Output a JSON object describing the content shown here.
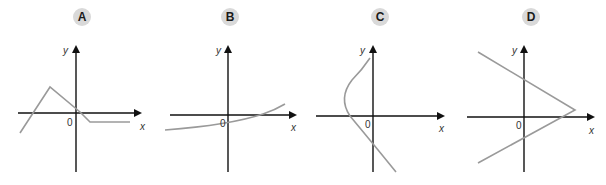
{
  "graphs": [
    {
      "id": "A",
      "label": "A",
      "x_axis_label": "x",
      "y_axis_label": "y",
      "origin_label": "0",
      "description": "Piecewise linear: rises from lower-left, peaks in second quadrant, falls through origin area, then flat horizontal below x-axis"
    },
    {
      "id": "B",
      "label": "B",
      "x_axis_label": "x",
      "y_axis_label": "y",
      "origin_label": "0",
      "description": "Gently increasing concave-up curve, negative y-intercept, crossing x-axis at positive x"
    },
    {
      "id": "C",
      "label": "C",
      "x_axis_label": "x",
      "y_axis_label": "y",
      "origin_label": "0",
      "description": "Curve bulging to the left of the y-axis (not a function of x), ending lower-right"
    },
    {
      "id": "D",
      "label": "D",
      "x_axis_label": "x",
      "y_axis_label": "y",
      "origin_label": "0",
      "description": "Sideways V shape opening to the left with vertex on the right, slightly above the x-axis"
    }
  ],
  "colors": {
    "axis": "#111111",
    "curve": "#9a9a9a",
    "badge_bg": "#d9d9d9",
    "badge_text": "#1a1a1a"
  }
}
